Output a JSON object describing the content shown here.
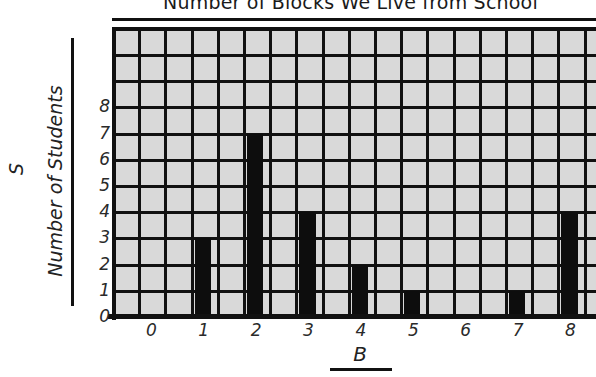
{
  "chart_data": {
    "type": "bar",
    "title": "Number of Blocks We Live from School",
    "xlabel": "B",
    "ylabel": "Number of Students",
    "ylabel_letter": "S",
    "categories": [
      "0",
      "1",
      "2",
      "3",
      "4",
      "5",
      "6",
      "7",
      "8"
    ],
    "values": [
      0,
      3,
      7,
      4,
      2,
      1,
      0,
      1,
      4
    ],
    "ylim": [
      0,
      11
    ],
    "y_ticks": [
      "8",
      "7",
      "6",
      "5",
      "4",
      "3",
      "2",
      "1",
      "0"
    ],
    "grid": true,
    "legend": "none",
    "bar_color": "#0d0d0d",
    "plot_background": "#d9d9d9",
    "grid_color": "#111111"
  },
  "axes": {
    "y_tick_values": [
      8,
      7,
      6,
      5,
      4,
      3,
      2,
      1,
      0
    ],
    "x_tick_values": [
      0,
      1,
      2,
      3,
      4,
      5,
      6,
      7,
      8
    ]
  }
}
